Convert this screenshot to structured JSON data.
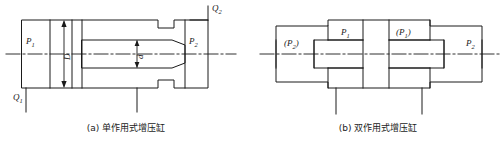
{
  "figure": {
    "type": "engineering-drawing",
    "line_color": "#1a1a1a",
    "background_color": "#ffffff"
  },
  "panel_a": {
    "caption": "(a) 单作用式增压缸",
    "caption_label": "(a)",
    "caption_text": "单作用式增压缸",
    "labels": {
      "p1": "P",
      "p1_sub": "1",
      "p2": "P",
      "p2_sub": "2",
      "q1": "Q",
      "q1_sub": "1",
      "q2": "Q",
      "q2_sub": "2",
      "diameter_large": "D",
      "diameter_small": "d"
    }
  },
  "panel_b": {
    "caption": "(b) 双作用式增压缸",
    "caption_label": "(b)",
    "caption_text": "双作用式增压缸",
    "labels": {
      "p1_left": "P",
      "p1_left_sub": "1",
      "p1_right": "(P",
      "p1_right_sub": "1",
      "p1_right_close": ")",
      "p2_left_open": "(P",
      "p2_left_sub": "2",
      "p2_left_close": ")",
      "p2_right": "P",
      "p2_right_sub": "2"
    }
  }
}
